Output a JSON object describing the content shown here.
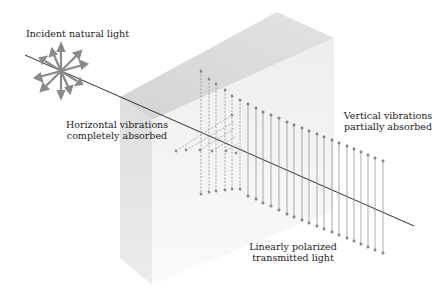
{
  "labels": {
    "incident": "Incident natural light",
    "horizontal_line1": "Horizontal vibrations",
    "horizontal_line2": "completely absorbed",
    "vertical_line1": "Vertical vibrations",
    "vertical_line2": "partially absorbed",
    "transmitted_line1": "Linearly polarized",
    "transmitted_line2": "transmitted light"
  },
  "colors": {
    "box_top": "#dcdcdc",
    "box_side": "#e6e6e6",
    "box_front": "#f2f2f2",
    "arrow": "#8a8a8a",
    "ray": "#333333",
    "vector": "#888888"
  }
}
